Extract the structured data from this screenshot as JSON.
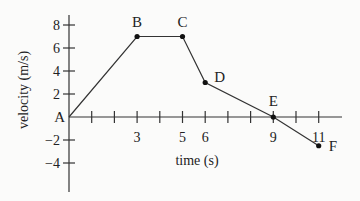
{
  "chart_data": {
    "type": "line",
    "title": "",
    "xlabel": "time (s)",
    "ylabel": "velocity (m/s)",
    "xlim": [
      0,
      12
    ],
    "ylim": [
      -5,
      9
    ],
    "x_ticks_labeled": [
      3,
      5,
      6,
      9,
      11
    ],
    "y_ticks": [
      8,
      6,
      4,
      2,
      -2,
      -4
    ],
    "y_tick_labels": [
      "8",
      "6",
      "4",
      "2",
      "−2",
      "−4"
    ],
    "points": [
      {
        "label": "A",
        "x": 0,
        "y": 0
      },
      {
        "label": "B",
        "x": 3,
        "y": 7
      },
      {
        "label": "C",
        "x": 5,
        "y": 7
      },
      {
        "label": "D",
        "x": 6,
        "y": 3
      },
      {
        "label": "E",
        "x": 9,
        "y": 0
      },
      {
        "label": "F",
        "x": 11,
        "y": -2.5
      }
    ],
    "grid": false,
    "legend": null
  }
}
